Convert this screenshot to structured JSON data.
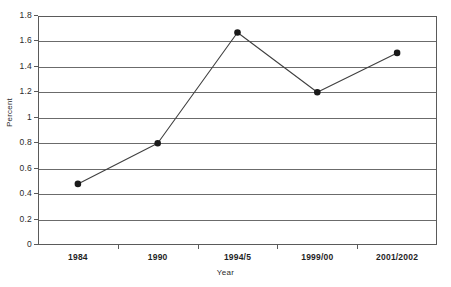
{
  "chart_data": {
    "type": "line",
    "title": "",
    "subtitle": "",
    "xlabel": "Year",
    "ylabel": "Percent",
    "categories": [
      "1984",
      "1990",
      "1994/5",
      "1999/00",
      "2001/2002"
    ],
    "values": [
      0.48,
      0.8,
      1.67,
      1.2,
      1.51
    ],
    "series": [
      {
        "name": "Percent",
        "values": [
          0.48,
          0.8,
          1.67,
          1.2,
          1.51
        ]
      }
    ],
    "ylim": [
      0,
      1.8
    ],
    "ytick_labels": [
      "0",
      "0.2",
      "0.4",
      "0.6",
      "0.8",
      "1",
      "1.2",
      "1.4",
      "1.6",
      "1.8"
    ],
    "ytick_values": [
      0,
      0.2,
      0.4,
      0.6,
      0.8,
      1.0,
      1.2,
      1.4,
      1.6,
      1.8
    ],
    "grid": true,
    "grid_axis": "y",
    "legend": false,
    "legend_position": "none",
    "marker": "filled-circle",
    "line_color": "#404040",
    "marker_color": "#1a1a1a",
    "grid_color": "#6b6b6b",
    "frame_color": "#5a5a5a",
    "background_color": "#ffffff"
  }
}
